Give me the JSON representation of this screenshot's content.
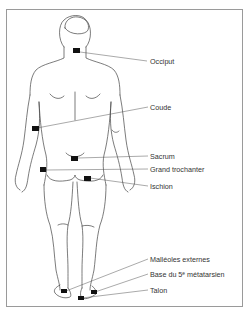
{
  "diagram": {
    "type": "anatomical-pressure-points",
    "view": "posterior",
    "labels": [
      {
        "id": "occiput",
        "text": "Occiput"
      },
      {
        "id": "coude",
        "text": "Coude"
      },
      {
        "id": "sacrum",
        "text": "Sacrum"
      },
      {
        "id": "grand_trochanter",
        "text": "Grand trochanter"
      },
      {
        "id": "ischion",
        "text": "Ischion"
      },
      {
        "id": "malleoles",
        "text": "Malléoles externes"
      },
      {
        "id": "base_metatarsien",
        "text": "Base du 5ᵉ métatarsien"
      },
      {
        "id": "talon",
        "text": "Talon"
      }
    ],
    "colors": {
      "line": "#555555",
      "marker": "#111111",
      "border": "#9a9a9a"
    }
  }
}
